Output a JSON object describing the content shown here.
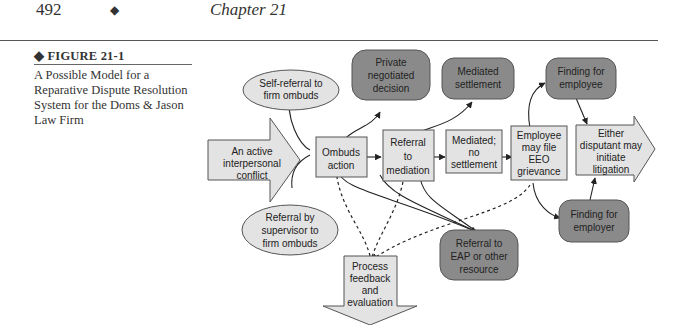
{
  "header": {
    "page_number": "492",
    "separator": "◆",
    "chapter": "Chapter 21"
  },
  "figure": {
    "label": "◆ FIGURE 21-1",
    "caption": "A Possible Model for a Reparative Dispute Resolution System for the Doms & Jason Law Firm"
  },
  "diagram": {
    "colors": {
      "light_fill": "#e3e3e3",
      "dark_fill": "#8a8a8a",
      "stroke": "#555555",
      "line": "#222222"
    },
    "nodes": {
      "start": [
        "An active",
        "interpersonal",
        "conflict"
      ],
      "self_referral": [
        "Self-referral to",
        "firm ombuds"
      ],
      "supervisor_referral": [
        "Referral by",
        "supervisor to",
        "firm ombuds"
      ],
      "ombuds_action": [
        "Ombuds",
        "action"
      ],
      "referral_mediation": [
        "Referral",
        "to",
        "mediation"
      ],
      "mediated_no_settlement": [
        "Mediated;",
        "no",
        "settlement"
      ],
      "employee_eeo": [
        "Employee",
        "may file",
        "EEO",
        "grievance"
      ],
      "litigation": [
        "Either",
        "disputant may",
        "initiate",
        "litigation"
      ],
      "private_decision": [
        "Private",
        "negotiated",
        "decision"
      ],
      "mediated_settlement": [
        "Mediated",
        "settlement"
      ],
      "finding_employee": [
        "Finding for",
        "employee"
      ],
      "finding_employer": [
        "Finding for",
        "employer"
      ],
      "referral_eap": [
        "Referral to",
        "EAP or other",
        "resource"
      ],
      "process_feedback": [
        "Process",
        "feedback",
        "and",
        "evaluation"
      ]
    }
  }
}
